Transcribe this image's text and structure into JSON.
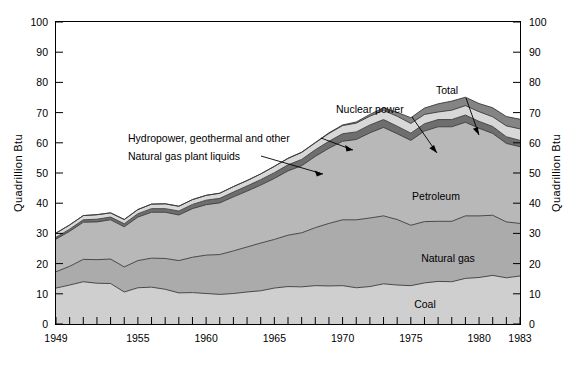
{
  "figure": {
    "background_color": "#ffffff",
    "plot_background_color": "#ffffff"
  },
  "axes": {
    "y_left": {
      "title": "Quadrillion Btu",
      "ticks": [
        0,
        10,
        20,
        30,
        40,
        50,
        60,
        70,
        80,
        90,
        100
      ],
      "tick_labels": [
        "0",
        "10",
        "20",
        "30",
        "40",
        "50",
        "60",
        "70",
        "80",
        "90",
        "100"
      ],
      "range": [
        0,
        100
      ]
    },
    "y_right": {
      "title": "Quadrillion Btu",
      "ticks": [
        0,
        10,
        20,
        30,
        40,
        50,
        60,
        70,
        80,
        90,
        100
      ],
      "tick_labels": [
        "0",
        "10",
        "20",
        "30",
        "40",
        "50",
        "60",
        "70",
        "80",
        "90",
        "100"
      ],
      "range": [
        0,
        100
      ]
    },
    "x": {
      "range": [
        1949,
        1983
      ],
      "major_tick_labels": [
        "1949",
        "1955",
        "1960",
        "1965",
        "1970",
        "1975",
        "1980",
        "1983"
      ],
      "major_tick_values": [
        1949,
        1955,
        1960,
        1965,
        1970,
        1975,
        1980,
        1983
      ],
      "minor_tick_every": 1
    }
  },
  "annotations": [
    {
      "name": "hydropower-label",
      "text": "Hydropower, geothermal  and other"
    },
    {
      "name": "ngpl-label",
      "text": "Natural gas plant liquids"
    },
    {
      "name": "nuclear-label",
      "text": "Nuclear power"
    },
    {
      "name": "total-label",
      "text": "Total"
    }
  ],
  "inline_labels": [
    {
      "name": "petroleum-label",
      "text": "Petroleum"
    },
    {
      "name": "natural-gas-label",
      "text": "Natural gas"
    },
    {
      "name": "coal-label",
      "text": "Coal"
    }
  ],
  "colors": {
    "coal": "#cfcfcf",
    "natural_gas": "#ababab",
    "petroleum": "#b8b8b8",
    "ngpl": "#6e6e6e",
    "hydropower": "#d8d8d8",
    "nuclear": "#848484",
    "outline": "#3a3a3a",
    "axis": "#000000"
  },
  "chart_data": {
    "type": "area",
    "stacked": true,
    "title": "",
    "xlabel": "",
    "ylabel": "Quadrillion Btu",
    "ylim": [
      0,
      100
    ],
    "xlim": [
      1949,
      1983
    ],
    "grid": false,
    "legend": "inline-annotations",
    "x": [
      1949,
      1950,
      1951,
      1952,
      1953,
      1954,
      1955,
      1956,
      1957,
      1958,
      1959,
      1960,
      1961,
      1962,
      1963,
      1964,
      1965,
      1966,
      1967,
      1968,
      1969,
      1970,
      1971,
      1972,
      1973,
      1974,
      1975,
      1976,
      1977,
      1978,
      1979,
      1980,
      1981,
      1982,
      1983
    ],
    "series": [
      {
        "name": "Coal",
        "values": [
          11.9,
          12.9,
          14.0,
          13.5,
          13.4,
          10.6,
          12.0,
          12.2,
          11.5,
          10.3,
          10.4,
          10.1,
          9.8,
          10.1,
          10.6,
          11.0,
          11.9,
          12.4,
          12.3,
          12.7,
          12.6,
          12.7,
          12.0,
          12.4,
          13.3,
          12.9,
          12.7,
          13.6,
          14.1,
          14.0,
          15.1,
          15.4,
          16.1,
          15.3,
          15.9
        ]
      },
      {
        "name": "Natural gas",
        "values": [
          5.4,
          6.2,
          7.4,
          7.8,
          8.1,
          8.3,
          9.0,
          9.6,
          10.2,
          10.7,
          11.7,
          12.7,
          13.2,
          14.1,
          14.9,
          15.8,
          16.1,
          17.0,
          17.9,
          19.2,
          20.7,
          21.8,
          22.5,
          22.7,
          22.5,
          21.7,
          20.0,
          20.3,
          19.9,
          20.0,
          20.7,
          20.4,
          19.9,
          18.5,
          17.4
        ]
      },
      {
        "name": "Petroleum",
        "values": [
          10.8,
          11.6,
          12.3,
          12.5,
          13.0,
          13.3,
          14.4,
          15.2,
          15.3,
          15.1,
          16.1,
          16.7,
          17.1,
          17.9,
          18.5,
          19.2,
          20.2,
          21.3,
          22.2,
          23.6,
          24.9,
          26.0,
          26.6,
          28.2,
          29.3,
          28.4,
          28.1,
          30.0,
          31.3,
          31.3,
          31.0,
          29.0,
          27.1,
          26.0,
          25.4
        ]
      },
      {
        "name": "Natural gas plant liquids",
        "values": [
          0.6,
          0.7,
          0.8,
          0.9,
          0.9,
          1.0,
          1.1,
          1.2,
          1.2,
          1.3,
          1.4,
          1.5,
          1.5,
          1.6,
          1.7,
          1.8,
          1.9,
          2.0,
          2.1,
          2.2,
          2.3,
          2.5,
          2.5,
          2.6,
          2.6,
          2.5,
          2.4,
          2.4,
          2.4,
          2.4,
          2.4,
          2.3,
          2.3,
          2.2,
          2.1
        ]
      },
      {
        "name": "Hydropower, geothermal and other",
        "values": [
          1.4,
          1.4,
          1.4,
          1.5,
          1.4,
          1.4,
          1.4,
          1.5,
          1.6,
          1.6,
          1.6,
          1.6,
          1.7,
          1.8,
          1.8,
          1.9,
          2.1,
          2.1,
          2.3,
          2.3,
          2.6,
          2.7,
          2.9,
          2.9,
          3.0,
          3.3,
          3.2,
          3.1,
          2.5,
          3.1,
          3.1,
          3.2,
          3.2,
          3.6,
          3.8
        ]
      },
      {
        "name": "Nuclear power",
        "values": [
          0.0,
          0.0,
          0.0,
          0.0,
          0.0,
          0.0,
          0.0,
          0.0,
          0.0,
          0.0,
          0.0,
          0.0,
          0.0,
          0.0,
          0.0,
          0.0,
          0.0,
          0.1,
          0.1,
          0.1,
          0.2,
          0.2,
          0.4,
          0.6,
          0.9,
          1.3,
          1.9,
          2.1,
          2.7,
          3.0,
          2.8,
          2.7,
          3.0,
          3.1,
          3.2
        ]
      }
    ],
    "total": [
      30.1,
      32.8,
      35.9,
      36.2,
      36.8,
      34.6,
      37.9,
      39.7,
      39.8,
      39.0,
      41.2,
      42.6,
      43.3,
      45.5,
      47.5,
      49.7,
      52.2,
      54.9,
      56.9,
      60.1,
      63.3,
      65.9,
      66.9,
      69.4,
      71.6,
      70.1,
      68.3,
      71.5,
      72.9,
      73.8,
      75.1,
      73.0,
      71.6,
      68.7,
      67.8
    ],
    "source_note": ""
  }
}
